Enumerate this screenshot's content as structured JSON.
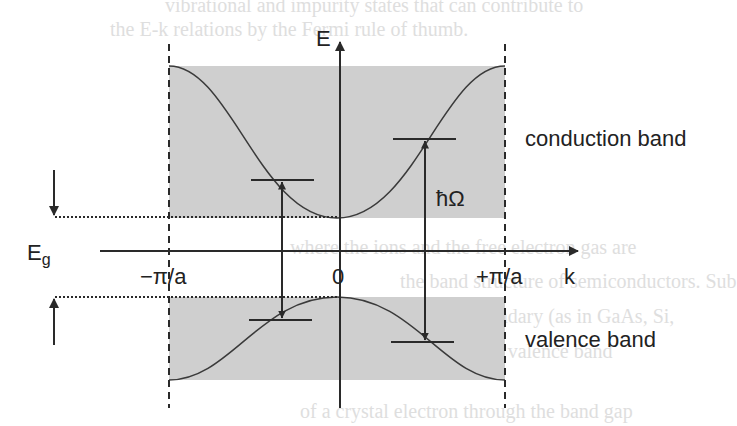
{
  "diagram": {
    "axes": {
      "energy_label": "E",
      "wavevector_label": "k",
      "tick_left": "−π/a",
      "tick_center": "0",
      "tick_right": "+π/a"
    },
    "bands": {
      "conduction_label": "conduction band",
      "valence_label": "valence band"
    },
    "gap_label": "E",
    "gap_subscript": "g",
    "photon_energy_label": "ħΩ",
    "colors": {
      "band_fill": "#cfcfcf",
      "line": "#2a2a2a",
      "background": "#ffffff"
    }
  },
  "background_text": {
    "line1": "vibrational and impurity states that can contribute to",
    "line2": "the E-k relations by the Fermi rule of thumb.",
    "line3": "where the ions and the free electron gas are",
    "line4": "the band structure of semiconductors. Sub",
    "line5": "region near the zone boundary (as in GaAs, Si,",
    "line6": "an electron is excited from the valence band",
    "line7": "of a crystal electron through the band gap"
  }
}
